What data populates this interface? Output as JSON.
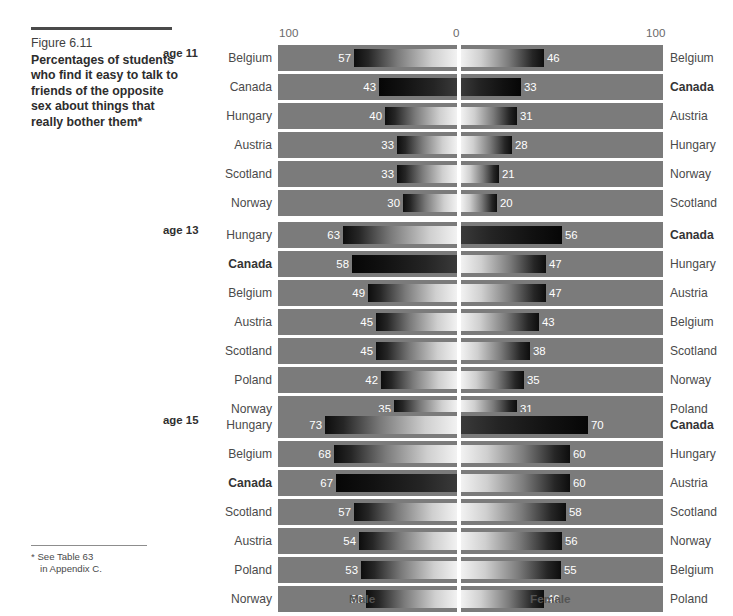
{
  "caption": {
    "figure_number": "Figure 6.11",
    "title": "Percentages of students who find it easy to talk to friends of the opposite sex about things that really bother them*"
  },
  "footnote": {
    "marker": "*",
    "line1": "See Table 63",
    "line2": "in Appendix C."
  },
  "axis": {
    "left_tick": "100",
    "center_tick": "0",
    "right_tick": "100",
    "male_label": "Male",
    "female_label": "Female"
  },
  "chart_data": {
    "type": "bar",
    "title": "Percentages of students who find it easy to talk to friends of the opposite sex about things that really bother them",
    "subtitle": "Figure 6.11",
    "xlabel": "",
    "ylabel": "",
    "xlim": [
      0,
      100
    ],
    "grid": false,
    "legend_position": "bottom",
    "orientation": "horizontal-diverging",
    "note": "Diverging (back-to-back) bar chart. Left pane = Male, right pane = Female. Each pane is independently rank-ordered by value, descending. Axis runs 100 (outer) to 0 (centre) to 100 (outer), units are percent.",
    "series": [
      {
        "name": "Male",
        "side": "left"
      },
      {
        "name": "Female",
        "side": "right"
      }
    ],
    "groups": [
      {
        "age_label": "age 11",
        "age": 11,
        "rows": [
          {
            "male_country": "Belgium",
            "male_value": 57,
            "male_bold": false,
            "male_dark": false,
            "female_country": "Belgium",
            "female_value": 46,
            "female_bold": false,
            "female_dark": false
          },
          {
            "male_country": "Canada",
            "male_value": 43,
            "male_bold": false,
            "male_dark": true,
            "female_country": "Canada",
            "female_value": 33,
            "female_bold": true,
            "female_dark": true
          },
          {
            "male_country": "Hungary",
            "male_value": 40,
            "male_bold": false,
            "male_dark": false,
            "female_country": "Austria",
            "female_value": 31,
            "female_bold": false,
            "female_dark": false
          },
          {
            "male_country": "Austria",
            "male_value": 33,
            "male_bold": false,
            "male_dark": false,
            "female_country": "Hungary",
            "female_value": 28,
            "female_bold": false,
            "female_dark": false
          },
          {
            "male_country": "Scotland",
            "male_value": 33,
            "male_bold": false,
            "male_dark": false,
            "female_country": "Norway",
            "female_value": 21,
            "female_bold": false,
            "female_dark": false
          },
          {
            "male_country": "Norway",
            "male_value": 30,
            "male_bold": false,
            "male_dark": false,
            "female_country": "Scotland",
            "female_value": 20,
            "female_bold": false,
            "female_dark": false
          }
        ]
      },
      {
        "age_label": "age 13",
        "age": 13,
        "rows": [
          {
            "male_country": "Hungary",
            "male_value": 63,
            "male_bold": false,
            "male_dark": false,
            "female_country": "Canada",
            "female_value": 56,
            "female_bold": true,
            "female_dark": true
          },
          {
            "male_country": "Canada",
            "male_value": 58,
            "male_bold": true,
            "male_dark": true,
            "female_country": "Hungary",
            "female_value": 47,
            "female_bold": false,
            "female_dark": false
          },
          {
            "male_country": "Belgium",
            "male_value": 49,
            "male_bold": false,
            "male_dark": false,
            "female_country": "Austria",
            "female_value": 47,
            "female_bold": false,
            "female_dark": false
          },
          {
            "male_country": "Austria",
            "male_value": 45,
            "male_bold": false,
            "male_dark": false,
            "female_country": "Belgium",
            "female_value": 43,
            "female_bold": false,
            "female_dark": false
          },
          {
            "male_country": "Scotland",
            "male_value": 45,
            "male_bold": false,
            "male_dark": false,
            "female_country": "Scotland",
            "female_value": 38,
            "female_bold": false,
            "female_dark": false
          },
          {
            "male_country": "Poland",
            "male_value": 42,
            "male_bold": false,
            "male_dark": false,
            "female_country": "Norway",
            "female_value": 35,
            "female_bold": false,
            "female_dark": false
          },
          {
            "male_country": "Norway",
            "male_value": 35,
            "male_bold": false,
            "male_dark": false,
            "female_country": "Poland",
            "female_value": 31,
            "female_bold": false,
            "female_dark": false
          }
        ]
      },
      {
        "age_label": "age 15",
        "age": 15,
        "rows": [
          {
            "male_country": "Hungary",
            "male_value": 73,
            "male_bold": false,
            "male_dark": false,
            "female_country": "Canada",
            "female_value": 70,
            "female_bold": true,
            "female_dark": true
          },
          {
            "male_country": "Belgium",
            "male_value": 68,
            "male_bold": false,
            "male_dark": false,
            "female_country": "Hungary",
            "female_value": 60,
            "female_bold": false,
            "female_dark": false
          },
          {
            "male_country": "Canada",
            "male_value": 67,
            "male_bold": true,
            "male_dark": true,
            "female_country": "Austria",
            "female_value": 60,
            "female_bold": false,
            "female_dark": false
          },
          {
            "male_country": "Scotland",
            "male_value": 57,
            "male_bold": false,
            "male_dark": false,
            "female_country": "Scotland",
            "female_value": 58,
            "female_bold": false,
            "female_dark": false
          },
          {
            "male_country": "Austria",
            "male_value": 54,
            "male_bold": false,
            "male_dark": false,
            "female_country": "Norway",
            "female_value": 56,
            "female_bold": false,
            "female_dark": false
          },
          {
            "male_country": "Poland",
            "male_value": 53,
            "male_bold": false,
            "male_dark": false,
            "female_country": "Belgium",
            "female_value": 55,
            "female_bold": false,
            "female_dark": false
          },
          {
            "male_country": "Norway",
            "male_value": 50,
            "male_bold": false,
            "male_dark": false,
            "female_country": "Poland",
            "female_value": 46,
            "female_bold": false,
            "female_dark": false
          }
        ]
      }
    ]
  },
  "colors": {
    "band": "#7b7b7b",
    "page": "#ffffff",
    "divider": "#ffffff",
    "text": "#4a4a4a",
    "value_text": "#ffffff",
    "bar_tip": "#0d0d0d"
  }
}
